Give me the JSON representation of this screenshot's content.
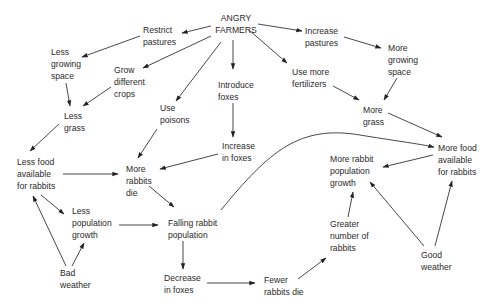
{
  "diagram": {
    "nodes": [
      {
        "id": "angry_farmers",
        "label": "ANGRY\nFARMERS",
        "x": 218,
        "y": 14,
        "align": "center"
      },
      {
        "id": "restrict_pastures",
        "label": "Restrict\npastures",
        "x": 143,
        "y": 24
      },
      {
        "id": "increase_pastures",
        "label": "Increase\npastures",
        "x": 305,
        "y": 24
      },
      {
        "id": "less_growing_space",
        "label": "Less\ngrowing\nspace",
        "x": 51,
        "y": 46
      },
      {
        "id": "more_growing_space",
        "label": "More\ngrowing\nspace",
        "x": 388,
        "y": 42
      },
      {
        "id": "grow_different_crops",
        "label": "Grow\ndifferent\ncrops",
        "x": 114,
        "y": 64
      },
      {
        "id": "introduce_foxes",
        "label": "Introduce\nfoxes",
        "x": 218,
        "y": 78
      },
      {
        "id": "use_more_fertilizers",
        "label": "Use more\nfertilizers",
        "x": 292,
        "y": 66
      },
      {
        "id": "use_poisons",
        "label": "Use\npoisons",
        "x": 160,
        "y": 102
      },
      {
        "id": "less_grass",
        "label": "Less\ngrass",
        "x": 64,
        "y": 110
      },
      {
        "id": "more_grass",
        "label": "More\ngrass",
        "x": 363,
        "y": 104
      },
      {
        "id": "increase_in_foxes",
        "label": "Increase\nin foxes",
        "x": 222,
        "y": 140
      },
      {
        "id": "more_food_available_right",
        "label": "More food\navailable\nfor rabbits",
        "x": 438,
        "y": 142
      },
      {
        "id": "less_food_available",
        "label": "Less food\navailable\nfor rabbits",
        "x": 17,
        "y": 156
      },
      {
        "id": "more_rabbits_die",
        "label": "More\nrabbits\ndie",
        "x": 126,
        "y": 163
      },
      {
        "id": "more_rabbit_population_growth",
        "label": "More rabbit\npopulation\ngrowth",
        "x": 330,
        "y": 153
      },
      {
        "id": "less_population_growth",
        "label": "Less\npopulation\ngrowth",
        "x": 72,
        "y": 205
      },
      {
        "id": "falling_rabbit_population",
        "label": "Falling rabbit\npopulation",
        "x": 168,
        "y": 217
      },
      {
        "id": "greater_number_of_rabbits",
        "label": "Greater\nnumber of\nrabbits",
        "x": 330,
        "y": 218
      },
      {
        "id": "good_weather",
        "label": "Good\nweather",
        "x": 421,
        "y": 249
      },
      {
        "id": "bad_weather",
        "label": "Bad\nweather",
        "x": 60,
        "y": 267
      },
      {
        "id": "decrease_in_foxes",
        "label": "Decrease\nin foxes",
        "x": 164,
        "y": 272
      },
      {
        "id": "fewer_rabbits_die",
        "label": "Fewer\nrabbits die",
        "x": 264,
        "y": 274
      }
    ],
    "edges": [
      {
        "from": "angry_farmers",
        "to": "restrict_pastures"
      },
      {
        "from": "angry_farmers",
        "to": "increase_pastures"
      },
      {
        "from": "angry_farmers",
        "to": "grow_different_crops"
      },
      {
        "from": "angry_farmers",
        "to": "use_poisons"
      },
      {
        "from": "angry_farmers",
        "to": "introduce_foxes"
      },
      {
        "from": "angry_farmers",
        "to": "use_more_fertilizers"
      },
      {
        "from": "restrict_pastures",
        "to": "less_growing_space"
      },
      {
        "from": "increase_pastures",
        "to": "more_growing_space"
      },
      {
        "from": "less_growing_space",
        "to": "less_grass"
      },
      {
        "from": "grow_different_crops",
        "to": "less_grass"
      },
      {
        "from": "more_growing_space",
        "to": "more_grass"
      },
      {
        "from": "use_more_fertilizers",
        "to": "more_grass"
      },
      {
        "from": "introduce_foxes",
        "to": "increase_in_foxes"
      },
      {
        "from": "less_grass",
        "to": "less_food_available"
      },
      {
        "from": "more_grass",
        "to": "more_food_available_right"
      },
      {
        "from": "use_poisons",
        "to": "more_rabbits_die"
      },
      {
        "from": "increase_in_foxes",
        "to": "more_rabbits_die"
      },
      {
        "from": "less_food_available",
        "to": "more_rabbits_die"
      },
      {
        "from": "less_food_available",
        "to": "less_population_growth"
      },
      {
        "from": "more_rabbits_die",
        "to": "falling_rabbit_population"
      },
      {
        "from": "less_population_growth",
        "to": "falling_rabbit_population"
      },
      {
        "from": "falling_rabbit_population",
        "to": "more_food_available_right"
      },
      {
        "from": "falling_rabbit_population",
        "to": "decrease_in_foxes"
      },
      {
        "from": "decrease_in_foxes",
        "to": "fewer_rabbits_die"
      },
      {
        "from": "fewer_rabbits_die",
        "to": "greater_number_of_rabbits"
      },
      {
        "from": "greater_number_of_rabbits",
        "to": "more_rabbit_population_growth"
      },
      {
        "from": "more_food_available_right",
        "to": "more_rabbit_population_growth"
      },
      {
        "from": "good_weather",
        "to": "more_rabbit_population_growth"
      },
      {
        "from": "good_weather",
        "to": "more_food_available_right"
      },
      {
        "from": "bad_weather",
        "to": "less_food_available"
      },
      {
        "from": "bad_weather",
        "to": "less_population_growth"
      }
    ]
  }
}
